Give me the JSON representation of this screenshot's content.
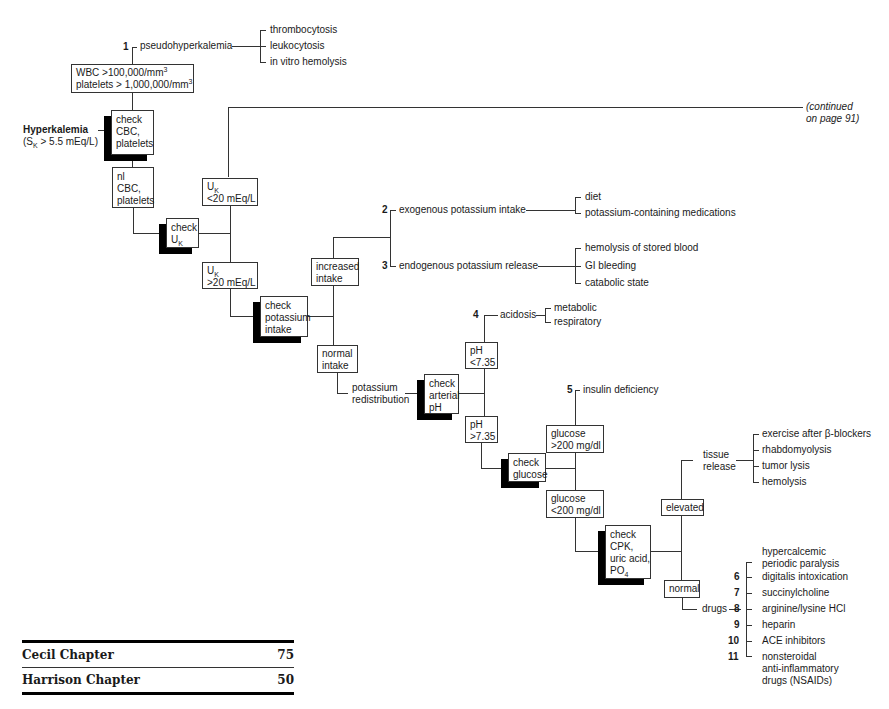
{
  "title": {
    "main": "Hyperkalemia",
    "criterion": "(S",
    "criterion_sub": "K",
    "criterion_rest": " > 5.5 mEq/L)"
  },
  "continued": {
    "line1": "(continued",
    "line2": "on page 91)"
  },
  "nodes": {
    "check_cbc": [
      "check",
      "CBC,",
      "platelets"
    ],
    "wbc": {
      "line1_pre": "WBC >100,000/mm",
      "line1_sup": "3",
      "line2_pre": "platelets > 1,000,000/mm",
      "line2_sup": "3"
    },
    "nl_cbc": [
      "nl",
      "CBC,",
      "platelets"
    ],
    "check_uk": {
      "line1": "check",
      "line2_pre": "U",
      "line2_sub": "K"
    },
    "uk_low": {
      "line1_pre": "U",
      "line1_sub": "K",
      "line2": "<20 mEq/L"
    },
    "uk_high": {
      "line1_pre": "U",
      "line1_sub": "K",
      "line2": ">20 mEq/L"
    },
    "check_intake": [
      "check",
      "potassium",
      "intake"
    ],
    "increased_intake": [
      "increased",
      "intake"
    ],
    "normal_intake": [
      "normal",
      "intake"
    ],
    "check_ph": [
      "check",
      "arterial",
      "pH"
    ],
    "ph_low": [
      "pH",
      "<7.35"
    ],
    "ph_high": [
      "pH",
      ">7.35"
    ],
    "check_glucose": [
      "check",
      "glucose"
    ],
    "glucose_high": [
      "glucose",
      ">200 mg/dl"
    ],
    "glucose_low": [
      "glucose",
      "<200 mg/dl"
    ],
    "check_cpk": {
      "lines": [
        "check",
        "CPK,",
        "uric acid,"
      ],
      "last_pre": "PO",
      "last_sub": "4"
    },
    "elevated": "elevated",
    "normal": "normal"
  },
  "branches": {
    "pseudo": {
      "num": "1",
      "label": "pseudohyperkalemia",
      "causes": [
        "thrombocytosis",
        "leukocytosis",
        "in vitro hemolysis"
      ]
    },
    "exogenous": {
      "num": "2",
      "label": "exogenous potassium intake",
      "causes": [
        "diet",
        "potassium-containing medications"
      ]
    },
    "endogenous": {
      "num": "3",
      "label": "endogenous potassium release",
      "causes": [
        "hemolysis of stored blood",
        "GI bleeding",
        "catabolic state"
      ]
    },
    "acidosis": {
      "num": "4",
      "label": "acidosis",
      "causes": [
        "metabolic",
        "respiratory"
      ]
    },
    "insulin": {
      "num": "5",
      "label": "insulin deficiency"
    },
    "redistribution": [
      "potassium",
      "redistribution"
    ],
    "tissue": {
      "label": [
        "tissue",
        "release"
      ],
      "causes": [
        "exercise after β-blockers",
        "rhabdomyolysis",
        "tumor lysis",
        "hemolysis"
      ]
    },
    "drugs": {
      "label": "drugs",
      "items": [
        {
          "num": "",
          "text": [
            "hypercalcemic",
            "periodic paralysis"
          ]
        },
        {
          "num": "6",
          "text": [
            "digitalis intoxication"
          ]
        },
        {
          "num": "7",
          "text": [
            "succinylcholine"
          ]
        },
        {
          "num": "8",
          "text": [
            "arginine/lysine HCl"
          ]
        },
        {
          "num": "9",
          "text": [
            "heparin"
          ]
        },
        {
          "num": "10",
          "text": [
            "ACE inhibitors"
          ]
        },
        {
          "num": "11",
          "text": [
            "nonsteroidal",
            "anti-inflammatory",
            "drugs (NSAIDs)"
          ]
        }
      ]
    }
  },
  "references": [
    {
      "label": "Cecil Chapter",
      "value": "75"
    },
    {
      "label": "Harrison Chapter",
      "value": "50"
    }
  ]
}
